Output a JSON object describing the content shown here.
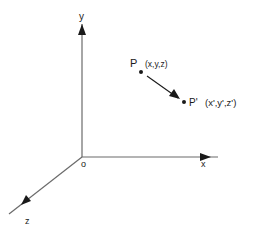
{
  "diagram": {
    "title": "",
    "type": "3d-coordinate-translation",
    "colors": {
      "axis": "#6b6b6b",
      "ink": "#1a1a1a",
      "background": "#ffffff"
    },
    "axes": {
      "x": {
        "label": "x"
      },
      "y": {
        "label": "y"
      },
      "z": {
        "label": "z"
      },
      "origin": {
        "label": "o"
      }
    },
    "points": {
      "p": {
        "name": "P",
        "coords": "(x,y,z)"
      },
      "p_prime": {
        "name": "P'",
        "coords": "(x',y',z')"
      }
    },
    "arrow": {
      "from": "P",
      "to": "P'"
    }
  }
}
